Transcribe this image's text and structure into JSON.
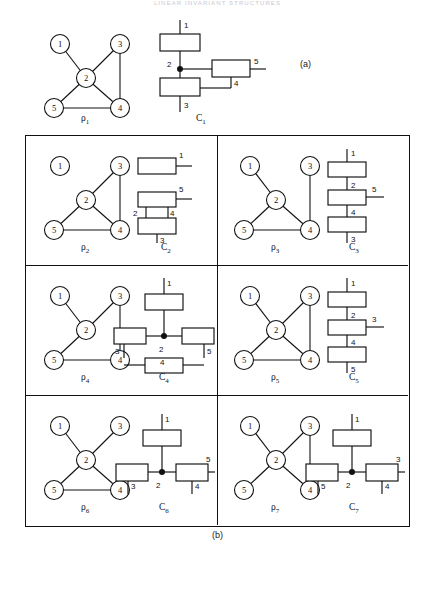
{
  "running_head": "LINEAR INVARIANT STRUCTURES",
  "captions": {
    "a": "(a)",
    "b": "(b)"
  },
  "panel_a": {
    "graph_label": "ρ",
    "graph_sub": "1",
    "circuit_label": "C",
    "circuit_sub": "1"
  },
  "node_labels": [
    "1",
    "2",
    "3",
    "4",
    "5"
  ],
  "terminal_labels": [
    "1",
    "2",
    "3",
    "4",
    "5"
  ],
  "cells": [
    {
      "graph_label": "ρ",
      "graph_sub": "2",
      "circuit_label": "C",
      "circuit_sub": "2"
    },
    {
      "graph_label": "ρ",
      "graph_sub": "3",
      "circuit_label": "C",
      "circuit_sub": "3"
    },
    {
      "graph_label": "ρ",
      "graph_sub": "4",
      "circuit_label": "C",
      "circuit_sub": "4"
    },
    {
      "graph_label": "ρ",
      "graph_sub": "5",
      "circuit_label": "C",
      "circuit_sub": "5"
    },
    {
      "graph_label": "ρ",
      "graph_sub": "6",
      "circuit_label": "C",
      "circuit_sub": "6"
    },
    {
      "graph_label": "ρ",
      "graph_sub": "7",
      "circuit_label": "C",
      "circuit_sub": "7"
    }
  ],
  "graphs": {
    "rho1": {
      "nodes": [
        "1",
        "2",
        "3",
        "4",
        "5"
      ],
      "edges": [
        [
          "1",
          "2"
        ],
        [
          "2",
          "3"
        ],
        [
          "3",
          "4"
        ],
        [
          "2",
          "4"
        ],
        [
          "2",
          "5"
        ],
        [
          "5",
          "4"
        ]
      ]
    },
    "rho2": {
      "nodes": [
        "1",
        "2",
        "3",
        "4",
        "5"
      ],
      "edges": [
        [
          "2",
          "3"
        ],
        [
          "3",
          "4"
        ],
        [
          "2",
          "4"
        ],
        [
          "2",
          "5"
        ],
        [
          "5",
          "4"
        ]
      ]
    },
    "rho3": {
      "nodes": [
        "1",
        "2",
        "3",
        "4",
        "5"
      ],
      "edges": [
        [
          "1",
          "2"
        ],
        [
          "3",
          "4"
        ],
        [
          "2",
          "4"
        ],
        [
          "2",
          "5"
        ],
        [
          "5",
          "4"
        ]
      ]
    },
    "rho4": {
      "nodes": [
        "1",
        "2",
        "3",
        "4",
        "5"
      ],
      "edges": [
        [
          "1",
          "2"
        ],
        [
          "2",
          "3"
        ],
        [
          "3",
          "4"
        ],
        [
          "2",
          "5"
        ],
        [
          "5",
          "4"
        ]
      ]
    },
    "rho5": {
      "nodes": [
        "1",
        "2",
        "3",
        "4",
        "5"
      ],
      "edges": [
        [
          "1",
          "2"
        ],
        [
          "2",
          "3"
        ],
        [
          "3",
          "4"
        ],
        [
          "2",
          "4"
        ],
        [
          "5",
          "4"
        ]
      ]
    },
    "rho6": {
      "nodes": [
        "1",
        "2",
        "3",
        "4",
        "5"
      ],
      "edges": [
        [
          "1",
          "2"
        ],
        [
          "2",
          "3"
        ],
        [
          "2",
          "4"
        ],
        [
          "2",
          "5"
        ],
        [
          "5",
          "4"
        ]
      ]
    },
    "rho7": {
      "nodes": [
        "1",
        "2",
        "3",
        "4",
        "5"
      ],
      "edges": [
        [
          "1",
          "2"
        ],
        [
          "2",
          "3"
        ],
        [
          "3",
          "4"
        ],
        [
          "2",
          "4"
        ],
        [
          "2",
          "5"
        ]
      ]
    }
  },
  "circuits": {
    "C1": {
      "junction": "2",
      "elements": [
        "1",
        "3",
        "5"
      ],
      "links": [
        "4"
      ]
    },
    "C2": {
      "junction": null,
      "elements": [
        "1",
        "5",
        "3"
      ],
      "links": [
        "2",
        "4"
      ]
    },
    "C3": {
      "junction": null,
      "elements": [
        "1",
        "5",
        "3"
      ],
      "links": [
        "2",
        "4"
      ]
    },
    "C4": {
      "junction": "2",
      "elements": [
        "1",
        "3",
        "5",
        "4"
      ],
      "links": []
    },
    "C5": {
      "junction": null,
      "elements": [
        "1",
        "3",
        "5"
      ],
      "links": [
        "2",
        "4"
      ]
    },
    "C6": {
      "junction": "2",
      "elements": [
        "1",
        "3",
        "5"
      ],
      "links": [
        "4"
      ]
    },
    "C7": {
      "junction": "2",
      "elements": [
        "1",
        "5",
        "3"
      ],
      "links": [
        "4"
      ]
    }
  }
}
